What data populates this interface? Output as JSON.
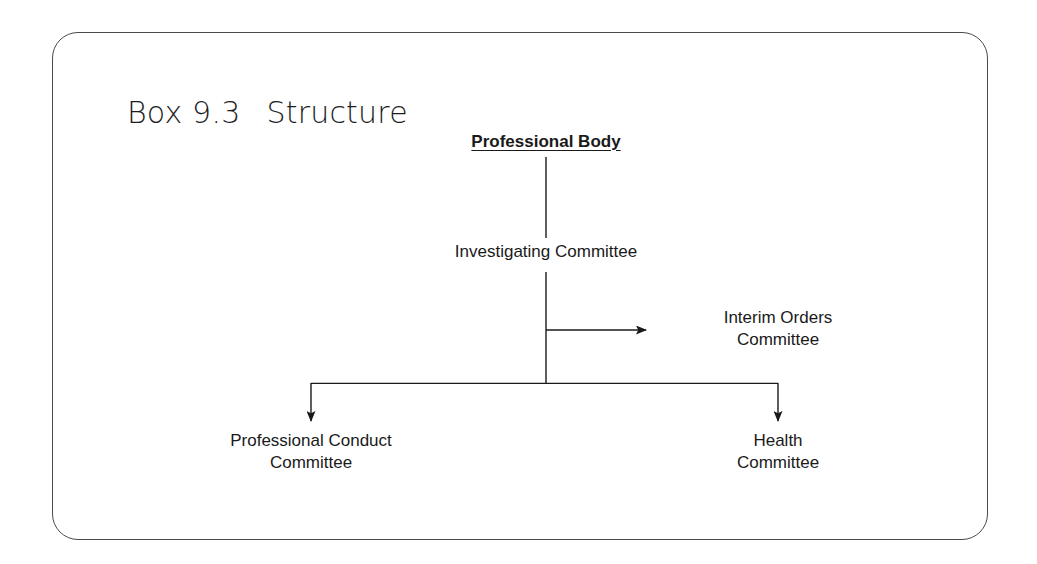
{
  "figure": {
    "label": "Box 9.3",
    "title": "Structure",
    "frame_color": "#4a4a4a",
    "line_color": "#1a1a1a",
    "background": "#ffffff"
  },
  "diagram": {
    "type": "organisational-hierarchy",
    "nodes": [
      {
        "id": "professional-body",
        "label": "Professional Body",
        "style": "bold-underlined",
        "level": 0,
        "x": 546,
        "y": 145
      },
      {
        "id": "investigating-committee",
        "label": "Investigating Committee",
        "style": "plain",
        "level": 1,
        "x": 546,
        "y": 255
      },
      {
        "id": "interim-orders-committee",
        "label": "Interim Orders\nCommittee",
        "style": "plain",
        "level": 2,
        "x": 778,
        "y": 332
      },
      {
        "id": "professional-conduct-committee",
        "label": "Professional Conduct\nCommittee",
        "style": "plain",
        "level": 2,
        "x": 311,
        "y": 455
      },
      {
        "id": "health-committee",
        "label": "Health\nCommittee",
        "style": "plain",
        "level": 2,
        "x": 778,
        "y": 455
      }
    ],
    "edges": [
      {
        "id": "edge-body-to-investigating",
        "from": "professional-body",
        "to": "investigating-committee",
        "kind": "vertical-line",
        "arrow": "none"
      },
      {
        "id": "edge-investigating-to-interim",
        "from": "investigating-committee",
        "to": "interim-orders-committee",
        "kind": "horizontal-branch",
        "arrow": "right"
      },
      {
        "id": "edge-investigating-to-conduct",
        "from": "investigating-committee",
        "to": "professional-conduct-committee",
        "kind": "elbow-branch",
        "arrow": "down"
      },
      {
        "id": "edge-investigating-to-health",
        "from": "investigating-committee",
        "to": "health-committee",
        "kind": "elbow-branch",
        "arrow": "down"
      }
    ]
  }
}
